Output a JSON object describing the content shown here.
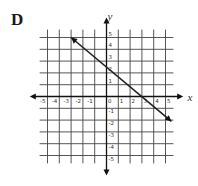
{
  "panel_label": "D",
  "axes": {
    "x_label": "x",
    "y_label": "y",
    "x_ticks": [
      "-5",
      "-4",
      "-3",
      "-2",
      "-1",
      "0",
      "1",
      "2",
      "3",
      "4",
      "5"
    ],
    "y_ticks": [
      "5",
      "4",
      "3",
      "2",
      "1",
      "-1",
      "-2",
      "-3",
      "-4",
      "-5"
    ],
    "range": [
      -5,
      5
    ]
  },
  "chart_data": {
    "type": "line",
    "title": "D",
    "xlabel": "x",
    "ylabel": "y",
    "xlim": [
      -5.5,
      5.5
    ],
    "ylim": [
      -5.5,
      5.5
    ],
    "grid": true,
    "series": [
      {
        "name": "line",
        "x": [
          -3,
          0,
          3,
          5.5
        ],
        "y": [
          5,
          2.5,
          0,
          -2.1
        ],
        "arrows": "both"
      }
    ],
    "equation": "y = -5/6 x + 5/2"
  },
  "colors": {
    "grid": "#444444",
    "axis": "#111111",
    "line": "#222222"
  }
}
